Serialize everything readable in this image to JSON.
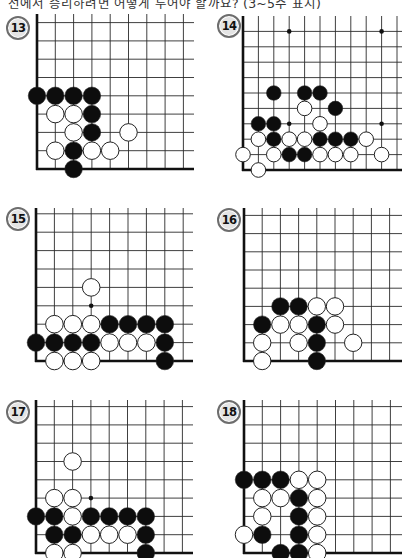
{
  "header": {
    "instruction": "선에서 승리하려면 어떻게 두어야 할까요? (3~5수 표시)"
  },
  "colors": {
    "grid_line": "#2a2a2a",
    "edge_line": "#111111",
    "black_stone": "#0d0d0d",
    "white_stone": "#ffffff",
    "stone_outline": "#222222",
    "label_ring": "#6d6d6d",
    "label_fill": "#e4e4e4"
  },
  "problems": [
    {
      "number": "13",
      "label_pos": [
        6,
        16
      ],
      "board": {
        "left": 37,
        "bottom": 169,
        "spacing": 18.3,
        "cols": 9,
        "rows": 9,
        "top_ext": 14,
        "right_end": 194
      },
      "star_points": [],
      "stones": [
        {
          "c": "B",
          "x": 0,
          "y": 4
        },
        {
          "c": "B",
          "x": 1,
          "y": 4
        },
        {
          "c": "B",
          "x": 2,
          "y": 4
        },
        {
          "c": "B",
          "x": 3,
          "y": 4
        },
        {
          "c": "W",
          "x": 1,
          "y": 3
        },
        {
          "c": "W",
          "x": 2,
          "y": 3
        },
        {
          "c": "B",
          "x": 3,
          "y": 3
        },
        {
          "c": "W",
          "x": 2,
          "y": 2
        },
        {
          "c": "B",
          "x": 3,
          "y": 2
        },
        {
          "c": "W",
          "x": 5,
          "y": 2
        },
        {
          "c": "W",
          "x": 1,
          "y": 1
        },
        {
          "c": "B",
          "x": 2,
          "y": 1
        },
        {
          "c": "W",
          "x": 3,
          "y": 1
        },
        {
          "c": "W",
          "x": 4,
          "y": 1
        },
        {
          "c": "B",
          "x": 2,
          "y": 0
        }
      ]
    },
    {
      "number": "14",
      "label_pos": [
        217,
        14
      ],
      "board": {
        "left": 243,
        "bottom": 170,
        "spacing": 15.4,
        "cols": 11,
        "rows": 10,
        "top_ext": 16,
        "right_end": 402
      },
      "star_points": [
        {
          "x": 3,
          "y": 9
        },
        {
          "x": 9,
          "y": 9
        },
        {
          "x": 3,
          "y": 3
        },
        {
          "x": 9,
          "y": 3
        }
      ],
      "stones": [
        {
          "c": "B",
          "x": 2,
          "y": 5
        },
        {
          "c": "B",
          "x": 4,
          "y": 5
        },
        {
          "c": "B",
          "x": 5,
          "y": 5
        },
        {
          "c": "W",
          "x": 4,
          "y": 4
        },
        {
          "c": "B",
          "x": 6,
          "y": 4
        },
        {
          "c": "B",
          "x": 1,
          "y": 3
        },
        {
          "c": "B",
          "x": 2,
          "y": 3
        },
        {
          "c": "W",
          "x": 5,
          "y": 3
        },
        {
          "c": "W",
          "x": 1,
          "y": 2
        },
        {
          "c": "B",
          "x": 2,
          "y": 2
        },
        {
          "c": "W",
          "x": 3,
          "y": 2
        },
        {
          "c": "W",
          "x": 4,
          "y": 2
        },
        {
          "c": "B",
          "x": 5,
          "y": 2
        },
        {
          "c": "B",
          "x": 6,
          "y": 2
        },
        {
          "c": "B",
          "x": 7,
          "y": 2
        },
        {
          "c": "W",
          "x": 8,
          "y": 2
        },
        {
          "c": "W",
          "x": 0,
          "y": 1
        },
        {
          "c": "W",
          "x": 2,
          "y": 1
        },
        {
          "c": "B",
          "x": 3,
          "y": 1
        },
        {
          "c": "B",
          "x": 4,
          "y": 1
        },
        {
          "c": "W",
          "x": 5,
          "y": 1
        },
        {
          "c": "W",
          "x": 6,
          "y": 1
        },
        {
          "c": "W",
          "x": 7,
          "y": 1
        },
        {
          "c": "W",
          "x": 9,
          "y": 1
        },
        {
          "c": "W",
          "x": 1,
          "y": 0
        }
      ]
    },
    {
      "number": "15",
      "label_pos": [
        6,
        207
      ],
      "board": {
        "left": 36,
        "bottom": 361,
        "spacing": 18.4,
        "cols": 9,
        "rows": 9,
        "top_ext": 208,
        "right_end": 193
      },
      "star_points": [
        {
          "x": 3,
          "y": 3
        }
      ],
      "stones": [
        {
          "c": "W",
          "x": 3,
          "y": 4
        },
        {
          "c": "W",
          "x": 1,
          "y": 2
        },
        {
          "c": "W",
          "x": 2,
          "y": 2
        },
        {
          "c": "W",
          "x": 3,
          "y": 2
        },
        {
          "c": "B",
          "x": 4,
          "y": 2
        },
        {
          "c": "B",
          "x": 5,
          "y": 2
        },
        {
          "c": "B",
          "x": 6,
          "y": 2
        },
        {
          "c": "B",
          "x": 7,
          "y": 2
        },
        {
          "c": "B",
          "x": 0,
          "y": 1
        },
        {
          "c": "B",
          "x": 1,
          "y": 1
        },
        {
          "c": "B",
          "x": 2,
          "y": 1
        },
        {
          "c": "B",
          "x": 3,
          "y": 1
        },
        {
          "c": "W",
          "x": 4,
          "y": 1
        },
        {
          "c": "W",
          "x": 5,
          "y": 1
        },
        {
          "c": "W",
          "x": 6,
          "y": 1
        },
        {
          "c": "B",
          "x": 7,
          "y": 1
        },
        {
          "c": "W",
          "x": 1,
          "y": 0
        },
        {
          "c": "W",
          "x": 2,
          "y": 0
        },
        {
          "c": "W",
          "x": 3,
          "y": 0
        },
        {
          "c": "B",
          "x": 7,
          "y": 0
        }
      ]
    },
    {
      "number": "16",
      "label_pos": [
        217,
        208
      ],
      "board": {
        "left": 244,
        "bottom": 361,
        "spacing": 18.2,
        "cols": 9,
        "rows": 9,
        "top_ext": 208,
        "right_end": 402
      },
      "star_points": [],
      "stones": [
        {
          "c": "B",
          "x": 2,
          "y": 3
        },
        {
          "c": "B",
          "x": 3,
          "y": 3
        },
        {
          "c": "W",
          "x": 4,
          "y": 3
        },
        {
          "c": "W",
          "x": 5,
          "y": 3
        },
        {
          "c": "B",
          "x": 1,
          "y": 2
        },
        {
          "c": "W",
          "x": 2,
          "y": 2
        },
        {
          "c": "W",
          "x": 3,
          "y": 2
        },
        {
          "c": "B",
          "x": 4,
          "y": 2
        },
        {
          "c": "W",
          "x": 5,
          "y": 2
        },
        {
          "c": "W",
          "x": 1,
          "y": 1
        },
        {
          "c": "W",
          "x": 3,
          "y": 1
        },
        {
          "c": "B",
          "x": 4,
          "y": 1
        },
        {
          "c": "W",
          "x": 6,
          "y": 1
        },
        {
          "c": "W",
          "x": 1,
          "y": 0
        },
        {
          "c": "B",
          "x": 4,
          "y": 0
        }
      ]
    },
    {
      "number": "17",
      "label_pos": [
        6,
        400
      ],
      "board": {
        "left": 36,
        "bottom": 553,
        "spacing": 18.3,
        "cols": 9,
        "rows": 9,
        "top_ext": 400,
        "right_end": 193
      },
      "star_points": [
        {
          "x": 3,
          "y": 3
        }
      ],
      "stones": [
        {
          "c": "W",
          "x": 2,
          "y": 5
        },
        {
          "c": "W",
          "x": 1,
          "y": 3
        },
        {
          "c": "W",
          "x": 2,
          "y": 3
        },
        {
          "c": "B",
          "x": 0,
          "y": 2
        },
        {
          "c": "B",
          "x": 1,
          "y": 2
        },
        {
          "c": "W",
          "x": 2,
          "y": 2
        },
        {
          "c": "B",
          "x": 3,
          "y": 2
        },
        {
          "c": "B",
          "x": 4,
          "y": 2
        },
        {
          "c": "B",
          "x": 5,
          "y": 2
        },
        {
          "c": "B",
          "x": 6,
          "y": 2
        },
        {
          "c": "B",
          "x": 1,
          "y": 1
        },
        {
          "c": "B",
          "x": 2,
          "y": 1
        },
        {
          "c": "W",
          "x": 3,
          "y": 1
        },
        {
          "c": "W",
          "x": 4,
          "y": 1
        },
        {
          "c": "W",
          "x": 5,
          "y": 1
        },
        {
          "c": "B",
          "x": 6,
          "y": 1
        },
        {
          "c": "W",
          "x": 1,
          "y": 0
        },
        {
          "c": "W",
          "x": 2,
          "y": 0
        },
        {
          "c": "B",
          "x": 6,
          "y": 0
        }
      ]
    },
    {
      "number": "18",
      "label_pos": [
        217,
        400
      ],
      "board": {
        "left": 244,
        "bottom": 553,
        "spacing": 18.3,
        "cols": 9,
        "rows": 9,
        "top_ext": 400,
        "right_end": 402
      },
      "star_points": [],
      "stones": [
        {
          "c": "B",
          "x": 0,
          "y": 4
        },
        {
          "c": "B",
          "x": 1,
          "y": 4
        },
        {
          "c": "B",
          "x": 2,
          "y": 4
        },
        {
          "c": "W",
          "x": 3,
          "y": 4
        },
        {
          "c": "W",
          "x": 4,
          "y": 4
        },
        {
          "c": "W",
          "x": 1,
          "y": 3
        },
        {
          "c": "W",
          "x": 2,
          "y": 3
        },
        {
          "c": "B",
          "x": 3,
          "y": 3
        },
        {
          "c": "W",
          "x": 4,
          "y": 3
        },
        {
          "c": "W",
          "x": 1,
          "y": 2
        },
        {
          "c": "B",
          "x": 3,
          "y": 2
        },
        {
          "c": "W",
          "x": 4,
          "y": 2
        },
        {
          "c": "W",
          "x": 0,
          "y": 1
        },
        {
          "c": "B",
          "x": 1,
          "y": 1
        },
        {
          "c": "B",
          "x": 3,
          "y": 1
        },
        {
          "c": "W",
          "x": 4,
          "y": 1
        },
        {
          "c": "B",
          "x": 2,
          "y": 0
        },
        {
          "c": "B",
          "x": 3,
          "y": 0
        },
        {
          "c": "W",
          "x": 4,
          "y": 0
        }
      ]
    }
  ]
}
